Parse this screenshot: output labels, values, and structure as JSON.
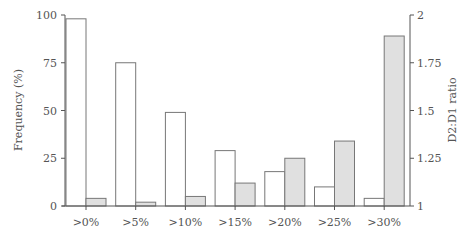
{
  "chart_data": {
    "type": "bar",
    "title": "",
    "categories": [
      ">0%",
      ">5%",
      ">10%",
      ">15%",
      ">20%",
      ">25%",
      ">30%"
    ],
    "series": [
      {
        "name": "Frequency (%)",
        "axis": "left",
        "color": "#ffffff",
        "values": [
          98,
          75,
          49,
          29,
          18,
          10,
          4
        ]
      },
      {
        "name": "D2:D1 ratio",
        "axis": "right",
        "color": "#e0e0e0",
        "values": [
          1.04,
          1.02,
          1.05,
          1.12,
          1.25,
          1.34,
          1.89
        ]
      }
    ],
    "xlabel": "",
    "ylabel": "Frequency (%)",
    "y2label": "D2:D1 ratio",
    "ylim": [
      0,
      100
    ],
    "y2lim": [
      1,
      2
    ],
    "yticks": [
      "0",
      "25",
      "50",
      "75",
      "100"
    ],
    "y2ticks": [
      "1",
      "1.25",
      "1.5",
      "1.75",
      "2"
    ],
    "grid": false,
    "legend": "none"
  }
}
